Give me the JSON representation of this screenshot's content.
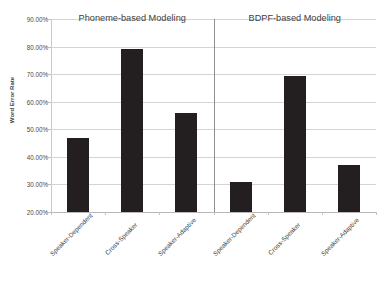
{
  "chart_data": {
    "type": "bar",
    "title": "",
    "subtitle": "",
    "xlabel": "",
    "ylabel": "Word Error Rate",
    "ylim": [
      20,
      90
    ],
    "ytick_labels": [
      "90.00%",
      "80.00%",
      "70.00%",
      "60.00%",
      "50.00%",
      "40.00%",
      "30.00%",
      "20.00%"
    ],
    "ytick_values": [
      90,
      80,
      70,
      60,
      50,
      40,
      30,
      20
    ],
    "grid": true,
    "legend": "none",
    "bar_color": "#231f20",
    "gridline_color": "#d4d4d4",
    "panels": [
      {
        "name": "Phoneme-based Modeling",
        "categories": [
          "Speaker-Dependent",
          "Cross-Speaker",
          "Speaker-Adaptive"
        ],
        "values": [
          47.0,
          79.3,
          55.8
        ]
      },
      {
        "name": "BDPF-based Modeling",
        "categories": [
          "Speaker-Dependent",
          "Cross-Speaker",
          "Speaker-Adaptive"
        ],
        "values": [
          31.0,
          69.5,
          37.0
        ]
      }
    ],
    "categories": [
      "Speaker-Dependent",
      "Cross-Speaker",
      "Speaker-Adaptive",
      "Speaker-Dependent",
      "Cross-Speaker",
      "Speaker-Adaptive"
    ],
    "values": [
      47.0,
      79.3,
      55.8,
      31.0,
      69.5,
      37.0
    ]
  }
}
